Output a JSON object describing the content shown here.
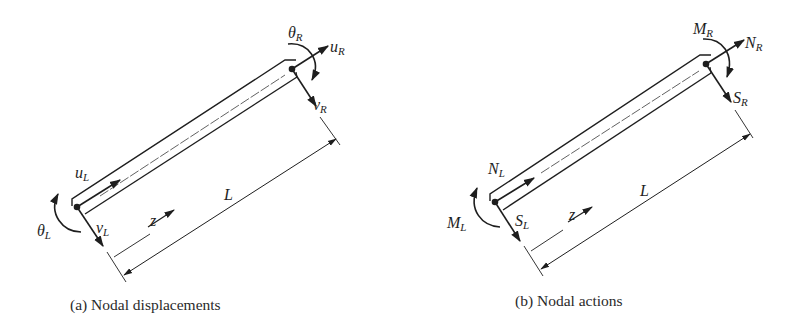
{
  "figure": {
    "panels": [
      {
        "caption": "(a) Nodal displacements",
        "labels": {
          "left_axial": {
            "main": "u",
            "sub": "L"
          },
          "left_transverse": {
            "main": "v",
            "sub": "L"
          },
          "left_rotation": {
            "main": "θ",
            "sub": "L"
          },
          "right_axial": {
            "main": "u",
            "sub": "R"
          },
          "right_transverse": {
            "main": "v",
            "sub": "R"
          },
          "right_rotation": {
            "main": "θ",
            "sub": "R"
          },
          "axis": "z",
          "length": "L"
        }
      },
      {
        "caption": "(b) Nodal actions",
        "labels": {
          "left_axial": {
            "main": "N",
            "sub": "L"
          },
          "left_transverse": {
            "main": "S",
            "sub": "L"
          },
          "left_rotation": {
            "main": "M",
            "sub": "L"
          },
          "right_axial": {
            "main": "N",
            "sub": "R"
          },
          "right_transverse": {
            "main": "S",
            "sub": "R"
          },
          "right_rotation": {
            "main": "M",
            "sub": "R"
          },
          "axis": "z",
          "length": "L"
        }
      }
    ],
    "colors": {
      "ink": "#1e1e1e",
      "background": "#ffffff"
    }
  }
}
